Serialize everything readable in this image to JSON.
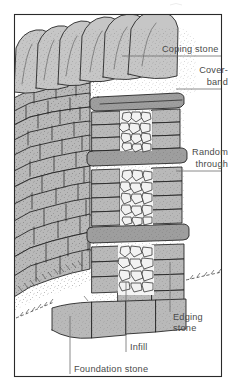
{
  "figure": {
    "frame": {
      "border_color": "#2a2a2a"
    }
  },
  "palette": {
    "stone_face": "#b9b9b9",
    "stone_top": "#c6c6c6",
    "stone_side": "#a8a8a8",
    "stone_dark": "#9e9e9e",
    "infill_rubble": "#f2f2f2",
    "outline": "#1d1d1d",
    "label_text": "#4a4a4a",
    "leader_line": "#6d6d6d",
    "background": "#ffffff"
  },
  "labels": [
    {
      "id": "coping-stone",
      "text": "Coping stone",
      "line1": "Coping stone",
      "line2": "",
      "align": "left",
      "x": 162,
      "y": 52
    },
    {
      "id": "cover-band",
      "text": "Cover-band",
      "line1": "Cover-",
      "line2": "band",
      "align": "right",
      "x": 228,
      "y": 73
    },
    {
      "id": "random-through",
      "text": "Random through",
      "line1": "Random",
      "line2": "through",
      "align": "right",
      "x": 228,
      "y": 161
    },
    {
      "id": "edging-stone",
      "text": "Edging stone",
      "line1": "Edging",
      "line2": "stone",
      "align": "left",
      "x": 172,
      "y": 318
    },
    {
      "id": "infill",
      "text": "Infill",
      "line1": "Infill",
      "line2": "",
      "align": "left",
      "x": 128,
      "y": 347
    },
    {
      "id": "foundation-stone",
      "text": "Foundation stone",
      "line1": "Foundation stone",
      "line2": "",
      "align": "left",
      "x": 72,
      "y": 371
    }
  ],
  "parts": [
    {
      "name": "Coping stone",
      "description": "Angled capping slabs along the wall top"
    },
    {
      "name": "Cover-band",
      "description": "Long flat slab course beneath the coping"
    },
    {
      "name": "Random through",
      "description": "Long stone spanning the wall width"
    },
    {
      "name": "Edging stone",
      "description": "Stone at the exposed wall end"
    },
    {
      "name": "Infill",
      "description": "Small rubble packed in the wall core"
    },
    {
      "name": "Foundation stone",
      "description": "Large base stones set at ground level"
    }
  ]
}
